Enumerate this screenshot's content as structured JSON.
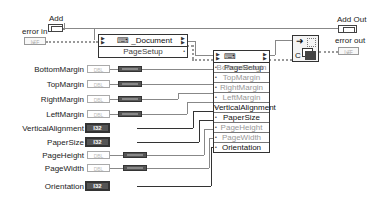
{
  "inputs": {
    "add": {
      "label": "Add"
    },
    "error_in": {
      "label": "error in",
      "type_text": "I∉F"
    }
  },
  "outputs": {
    "add_out": {
      "label": "Add Out"
    },
    "error_out": {
      "label": "error out",
      "type_text": "I∉F"
    }
  },
  "document_node": {
    "title": "_Document",
    "row": "PageSetup"
  },
  "pagesetup_node": {
    "title": "PageSetup",
    "rows": [
      "BottomMargin",
      "TopMargin",
      "RightMargin",
      "LeftMargin",
      "VerticalAlignment",
      "PaperSize",
      "PageHeight",
      "PageWidth",
      "Orientation"
    ]
  },
  "controls": [
    {
      "label": "BottomMargin",
      "type": "DBL"
    },
    {
      "label": "TopMargin",
      "type": "DBL"
    },
    {
      "label": "RightMargin",
      "type": "DBL"
    },
    {
      "label": "LeftMargin",
      "type": "DBL"
    },
    {
      "label": "VerticalAlignment",
      "type": "I32"
    },
    {
      "label": "PaperSize",
      "type": "I32"
    },
    {
      "label": "PageHeight",
      "type": "DBL"
    },
    {
      "label": "PageWidth",
      "type": "DBL"
    },
    {
      "label": "Orientation",
      "type": "I32"
    }
  ],
  "colors": {
    "wire": "#888888",
    "node_border": "#333333",
    "dim_text": "#999999"
  }
}
